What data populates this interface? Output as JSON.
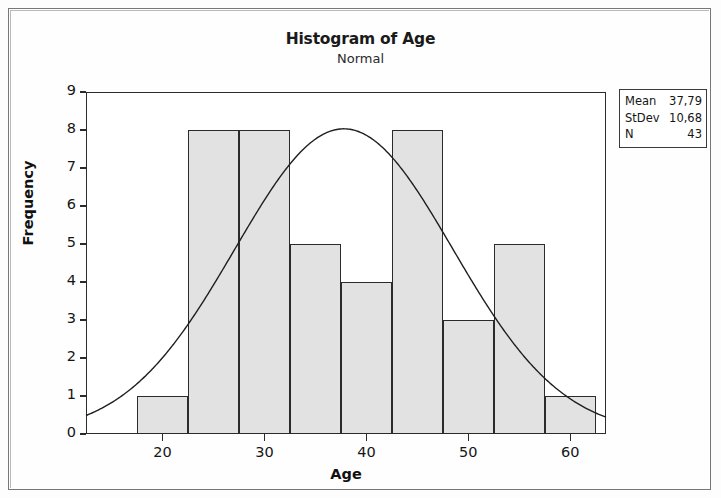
{
  "chart_data": {
    "type": "bar",
    "title": "Histogram of Age",
    "subtitle": "Normal",
    "xlabel": "Age",
    "ylabel": "Frequency",
    "xlim": [
      12.5,
      63.5
    ],
    "ylim": [
      0,
      9
    ],
    "grid": false,
    "bin_width": 5,
    "bin_edges": [
      17.5,
      22.5,
      27.5,
      32.5,
      37.5,
      42.5,
      47.5,
      52.5,
      57.5,
      62.5
    ],
    "bin_centers": [
      20,
      25,
      30,
      35,
      40,
      45,
      50,
      55,
      60
    ],
    "categories": [
      "20",
      "25",
      "30",
      "35",
      "40",
      "45",
      "50",
      "55",
      "60"
    ],
    "values": [
      1,
      8,
      8,
      5,
      4,
      8,
      3,
      5,
      1
    ],
    "x_ticks": [
      20,
      30,
      40,
      50,
      60
    ],
    "x_tick_labels": [
      "20",
      "30",
      "40",
      "50",
      "60"
    ],
    "y_ticks": [
      0,
      1,
      2,
      3,
      4,
      5,
      6,
      7,
      8,
      9
    ],
    "y_tick_labels": [
      "0",
      "1",
      "2",
      "3",
      "4",
      "5",
      "6",
      "7",
      "8",
      "9"
    ],
    "overlay": {
      "type": "line",
      "name": "Normal",
      "distribution": "normal",
      "mean": 37.79,
      "stdev": 10.68,
      "n": 43,
      "scale_note": "density * N * bin_width"
    },
    "legend_position": "outside right top",
    "bar_fill_color": "#e2e2e2",
    "bar_edge_color": "#2b2b2b",
    "curve_color": "#1f1f1f"
  },
  "stats_box": {
    "rows": [
      {
        "key": "Mean",
        "value": "37,79"
      },
      {
        "key": "StDev",
        "value": "10,68"
      },
      {
        "key": "N",
        "value": "43"
      }
    ]
  },
  "axis": {
    "y_title": "Frequency",
    "x_title": "Age"
  }
}
